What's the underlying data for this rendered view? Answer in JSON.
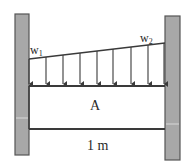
{
  "diagram": {
    "type": "fixed-fixed beam with linearly varying distributed load",
    "load": {
      "start_label": "w",
      "start_subscript": "1",
      "end_label": "w",
      "end_subscript": "2",
      "arrow_count": 9,
      "shape": "trapezoidal (increasing from w1 at left to w2 at right)"
    },
    "beam": {
      "cross_section_label": "A",
      "length_label": "1 m"
    },
    "supports": {
      "left": "fixed wall",
      "right": "fixed wall"
    },
    "colors": {
      "wall_fill": "#a8a8a8",
      "wall_border": "#555555",
      "line": "#3a3a3a",
      "background": "#ffffff"
    }
  }
}
